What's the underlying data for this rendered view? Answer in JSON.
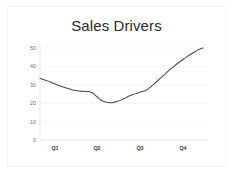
{
  "chart_data": {
    "type": "line",
    "title": "Sales Drivers",
    "xlabel": "",
    "ylabel": "",
    "ylim": [
      0,
      50
    ],
    "yticks": [
      0,
      10,
      20,
      30,
      40,
      50
    ],
    "ytick_labels": [
      "0",
      "10",
      "20",
      "30",
      "40",
      "50"
    ],
    "categories": [
      "Q1",
      "Q2",
      "Q3",
      "Q4"
    ],
    "xtick_labels": [
      "Q1",
      "Q2",
      "Q3",
      "Q4"
    ],
    "grid": true,
    "grid_axis": "y",
    "legend": false,
    "legend_position": "none",
    "series": [
      {
        "name": "Sales Drivers",
        "color": "#4a4a50",
        "x": [
          0.0,
          0.06,
          0.12,
          0.18,
          0.24,
          0.3,
          0.36,
          0.41,
          0.46,
          0.52,
          0.58,
          0.64,
          0.7,
          0.76,
          0.82,
          0.88,
          0.94,
          1.0
        ],
        "values": [
          33.5,
          32.0,
          30.2,
          28.6,
          27.2,
          26.5,
          26.3,
          23.5,
          20.6,
          20.3,
          21.8,
          24.0,
          25.6,
          27.0,
          30.5,
          34.5,
          38.5,
          42.0
        ]
      }
    ],
    "series_points_full": {
      "comment": "dense sampled polyline values 0-50 scale, left to right",
      "values": [
        33.5,
        32.8,
        32.0,
        31.1,
        30.2,
        29.4,
        28.6,
        27.9,
        27.2,
        26.8,
        26.5,
        26.4,
        26.3,
        25.4,
        23.5,
        21.6,
        20.6,
        20.3,
        20.4,
        21.0,
        21.8,
        22.9,
        24.0,
        24.8,
        25.6,
        26.3,
        27.0,
        28.6,
        30.5,
        32.5,
        34.5,
        36.5,
        38.5,
        40.3,
        42.0,
        43.6,
        45.2,
        46.6,
        48.0,
        49.2,
        50.0
      ]
    }
  },
  "meta": {
    "colors": {
      "line": "#4a4a50",
      "grid": "#f0f0f2",
      "axis": "#e2e2e5",
      "title_text": "#2b2b2b",
      "tick_text": "#6e6e72",
      "background": "#ffffff",
      "frame": "#f4f4f6"
    }
  }
}
